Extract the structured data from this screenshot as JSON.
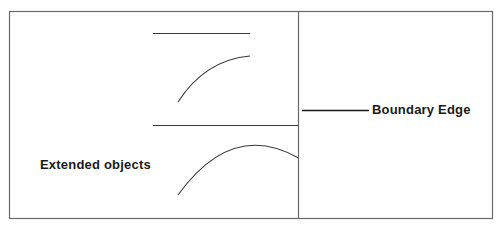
{
  "diagram": {
    "labels": {
      "extended_objects": "Extended objects",
      "boundary_edge": "Boundary Edge"
    },
    "colors": {
      "frame": "#6a6a6a",
      "lines": "#3a3a3a",
      "text": "#1a1a1a",
      "background": "#ffffff"
    },
    "regions": [
      {
        "name": "interior",
        "description": "left region containing objects"
      },
      {
        "name": "exterior",
        "description": "right region beyond boundary"
      }
    ],
    "objects": [
      {
        "type": "line",
        "name": "upper-straight-segment"
      },
      {
        "type": "arc",
        "name": "upper-arc"
      },
      {
        "type": "line",
        "name": "lower-straight-segment-touching-boundary"
      },
      {
        "type": "arc",
        "name": "lower-arc-crossing-boundary"
      }
    ]
  }
}
